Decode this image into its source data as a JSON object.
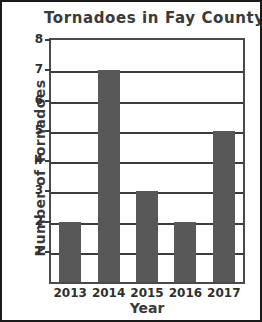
{
  "chart_data": {
    "type": "bar",
    "title": "Tornadoes in Fay County",
    "xlabel": "Year",
    "ylabel": "Number of Tornadoes",
    "categories": [
      "2013",
      "2014",
      "2015",
      "2016",
      "2017"
    ],
    "values": [
      2,
      7,
      3,
      2,
      5
    ],
    "ylim": [
      0,
      8
    ],
    "yticks": [
      "1",
      "2",
      "3",
      "4",
      "5",
      "6",
      "7",
      "8"
    ],
    "ytick_values": [
      1,
      2,
      3,
      4,
      5,
      6,
      7,
      8
    ],
    "grid": true,
    "legend": false,
    "bar_color": "#585858",
    "axis_color": "#3c3c3c",
    "text_color": "#3a3a3a",
    "background": "#ffffff"
  }
}
